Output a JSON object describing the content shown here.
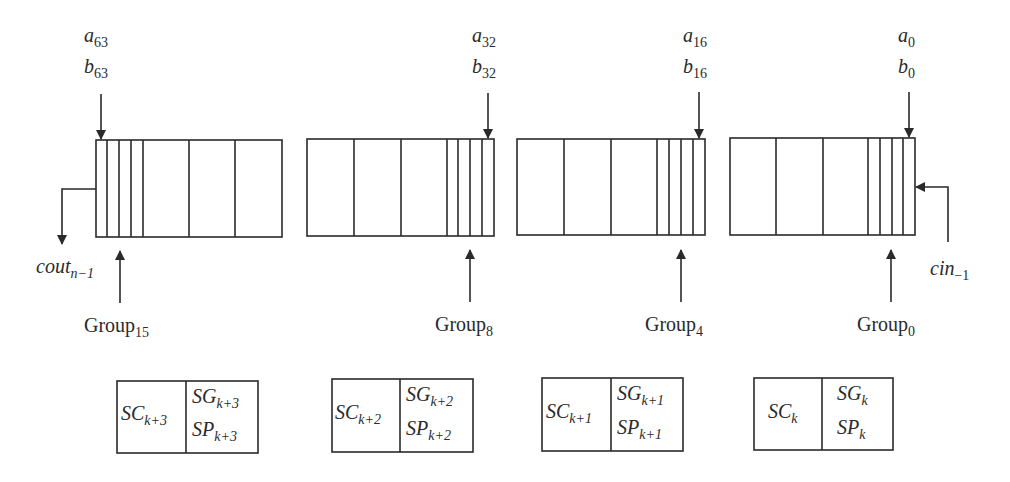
{
  "diagram": {
    "line_color": "#2a2a2a",
    "inputs": [
      {
        "a_var": "a",
        "a_sub": "63",
        "b_var": "b",
        "b_sub": "63"
      },
      {
        "a_var": "a",
        "a_sub": "32",
        "b_var": "b",
        "b_sub": "32"
      },
      {
        "a_var": "a",
        "a_sub": "16",
        "b_var": "b",
        "b_sub": "16"
      },
      {
        "a_var": "a",
        "a_sub": "0",
        "b_var": "b",
        "b_sub": "0"
      }
    ],
    "groups": [
      {
        "name": "Group",
        "sub": "15"
      },
      {
        "name": "Group",
        "sub": "8"
      },
      {
        "name": "Group",
        "sub": "4"
      },
      {
        "name": "Group",
        "sub": "0"
      }
    ],
    "carry_out": {
      "var": "cout",
      "sub": "n−1"
    },
    "carry_in": {
      "var": "cin",
      "sub": "−1"
    },
    "supergroups": [
      {
        "sc": "SC",
        "sc_sub": "k+3",
        "sg": "SG",
        "sg_sub": "k+3",
        "sp": "SP",
        "sp_sub": "k+3"
      },
      {
        "sc": "SC",
        "sc_sub": "k+2",
        "sg": "SG",
        "sg_sub": "k+2",
        "sp": "SP",
        "sp_sub": "k+2"
      },
      {
        "sc": "SC",
        "sc_sub": "k+1",
        "sg": "SG",
        "sg_sub": "k+1",
        "sp": "SP",
        "sp_sub": "k+1"
      },
      {
        "sc": "SC",
        "sc_sub": "k",
        "sg": "SG",
        "sg_sub": "k",
        "sp": "SP",
        "sp_sub": "k"
      }
    ]
  }
}
